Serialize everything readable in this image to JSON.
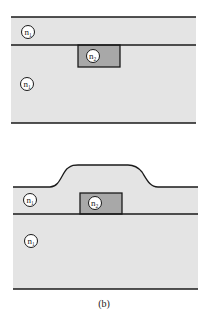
{
  "figure": {
    "caption": "(b)",
    "top_diagram": {
      "cladding_top_label": "n",
      "cladding_top_sub": "1",
      "core_label": "n",
      "core_sub": "2",
      "substrate_label": "n",
      "substrate_sub": "1"
    },
    "bottom_diagram": {
      "cladding_top_label": "n",
      "cladding_top_sub": "1",
      "core_label": "n",
      "core_sub": "2",
      "substrate_label": "n",
      "substrate_sub": "1"
    },
    "colors": {
      "cladding": "#e4e4e4",
      "core": "#a8a8a8",
      "line": "#1a1a1a"
    }
  }
}
